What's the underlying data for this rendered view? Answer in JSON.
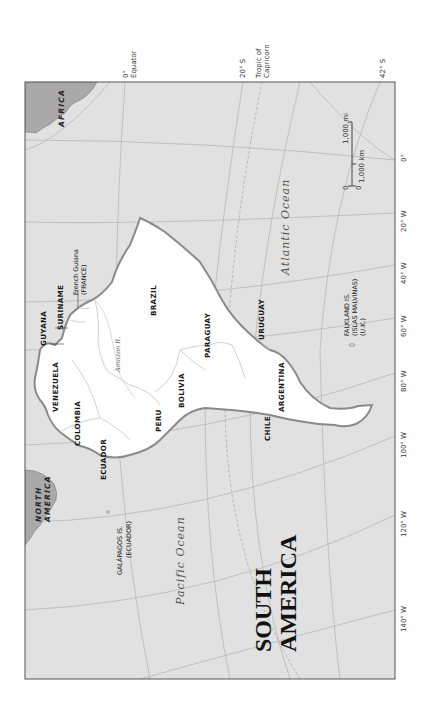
{
  "map": {
    "title": [
      "SOUTH",
      "AMERICA"
    ],
    "orientation": "rotated 90° clockwise",
    "colors": {
      "ocean": "#e1e1e1",
      "land": "#ffffff",
      "other_continents": "#a9a9a9",
      "coastline": "#8a8a8a",
      "graticule": "#b0b0b0",
      "frame": "#555555"
    },
    "continents": {
      "africa": "AFRICA",
      "north_america": [
        "NORTH",
        "AMERICA"
      ]
    },
    "oceans": {
      "atlantic": "Atlantic Ocean",
      "pacific": "Pacific Ocean"
    },
    "river": "Amazon R.",
    "countries": [
      {
        "name": "GUYANA"
      },
      {
        "name": "SURINAME"
      },
      {
        "name": "VENEZUELA"
      },
      {
        "name": "COLOMBIA"
      },
      {
        "name": "ECUADOR"
      },
      {
        "name": "PERU"
      },
      {
        "name": "BRAZIL"
      },
      {
        "name": "BOLIVIA"
      },
      {
        "name": "PARAGUAY"
      },
      {
        "name": "URUGUAY"
      },
      {
        "name": "ARGENTINA"
      },
      {
        "name": "CHILE"
      }
    ],
    "territories": {
      "french_guiana": [
        "French Guiana",
        "(FRANCE)"
      ],
      "falklands": [
        "FALKLAND IS.",
        "(ISLAS MALVINAS)",
        "(U.K.)"
      ],
      "galapagos": [
        "GALÁPAGOS IS.",
        "(ECUADOR)"
      ]
    },
    "latitude_labels": [
      {
        "label": "0°",
        "sub": "Equator"
      },
      {
        "label": "20° S"
      },
      {
        "label": "Tropic of",
        "sub": "Capricorn"
      },
      {
        "label": "42° S"
      }
    ],
    "longitude_labels": [
      "0°",
      "20° W",
      "40° W",
      "60° W",
      "80° W",
      "100° W",
      "120° W",
      "140° W"
    ],
    "scale_bar": {
      "mi_zero": "0",
      "km_zero": "0",
      "mi_label": "1,000 mi",
      "km_label": "1,000 km"
    }
  }
}
